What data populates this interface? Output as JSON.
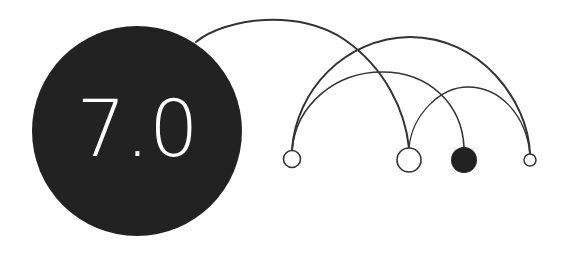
{
  "badge": {
    "label": "7.0",
    "fill_color": "#222222",
    "text_color": "#ffffff"
  },
  "diagram": {
    "stroke_color": "#333333",
    "nodes": [
      {
        "id": "node-1",
        "cx": 292,
        "cy": 159,
        "r": 9,
        "filled": false
      },
      {
        "id": "node-2",
        "cx": 409,
        "cy": 160,
        "r": 12,
        "filled": false
      },
      {
        "id": "node-3",
        "cx": 464,
        "cy": 160,
        "r": 13,
        "filled": true
      },
      {
        "id": "node-4",
        "cx": 530,
        "cy": 160,
        "r": 6,
        "filled": false
      }
    ],
    "arcs": [
      {
        "id": "arc-badge-to-node-2",
        "from": "badge",
        "to": "node-2"
      },
      {
        "id": "arc-node-1-to-node-4",
        "from": "node-1",
        "to": "node-4"
      },
      {
        "id": "arc-node-1-to-node-3",
        "from": "node-1",
        "to": "node-3"
      },
      {
        "id": "arc-node-2-to-node-4",
        "from": "node-2",
        "to": "node-4"
      }
    ]
  }
}
